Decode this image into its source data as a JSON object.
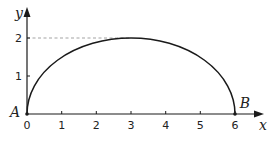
{
  "diagram": {
    "type": "semi-ellipse curve on axes",
    "axes": {
      "x_label": "x",
      "y_label": "y",
      "x_ticks": [
        "0",
        "1",
        "2",
        "3",
        "4",
        "5",
        "6"
      ],
      "y_ticks": [
        "1",
        "2"
      ]
    },
    "points": {
      "A": {
        "label": "A",
        "x": 0,
        "y": 0
      },
      "B": {
        "label": "B",
        "x": 6,
        "y": 0
      }
    },
    "curve": {
      "center_x": 3,
      "center_y": 0,
      "semi_axis_x": 3,
      "semi_axis_y": 2,
      "max_point": [
        3,
        2
      ]
    },
    "guide_line": {
      "style": "dashed",
      "y": 2,
      "from_x": 0,
      "to_x": 3
    },
    "colors": {
      "curve": "#1a1a1a",
      "axis": "#1a1a1a",
      "dashed": "#999999"
    }
  }
}
